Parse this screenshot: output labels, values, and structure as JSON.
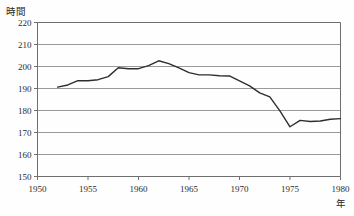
{
  "figure": {
    "background_color": "#fefefe",
    "frame_color": "#6e6e6e",
    "gridline_color": "#9a9a9a",
    "series_color": "#2e2e2e"
  },
  "axis_titles": {
    "y": "時間",
    "x": "年"
  },
  "chart_data": {
    "type": "line",
    "title": "",
    "subtitle": "",
    "xlabel": "年",
    "ylabel": "時間",
    "xlim": [
      1950,
      1980
    ],
    "ylim": [
      150,
      220
    ],
    "grid": true,
    "legend": "none",
    "x_ticks": [
      1950,
      1955,
      1960,
      1965,
      1970,
      1975,
      1980
    ],
    "x_tick_labels": [
      "1950",
      "1955",
      "1960",
      "1965",
      "1970",
      "1975",
      "1980"
    ],
    "y_ticks": [
      150,
      160,
      170,
      180,
      190,
      200,
      210,
      220
    ],
    "y_tick_labels": [
      "150",
      "160",
      "170",
      "180",
      "190",
      "200",
      "210",
      "220"
    ],
    "series": [
      {
        "name": "年間総実労働時間",
        "color": "#2e2e2e",
        "x": [
          1952,
          1953,
          1954,
          1955,
          1956,
          1957,
          1958,
          1959,
          1960,
          1961,
          1962,
          1963,
          1964,
          1965,
          1966,
          1967,
          1968,
          1969,
          1970,
          1971,
          1972,
          1973,
          1974,
          1975,
          1976,
          1977,
          1978,
          1979,
          1980
        ],
        "values": [
          190.6,
          191.6,
          193.6,
          193.5,
          194.0,
          195.4,
          199.4,
          199.0,
          199.0,
          200.4,
          202.6,
          201.3,
          199.4,
          197.2,
          196.2,
          196.2,
          195.8,
          195.7,
          193.5,
          191.2,
          188.0,
          186.2,
          179.8,
          172.6,
          175.5,
          175.0,
          175.2,
          176.0,
          176.3
        ]
      }
    ]
  }
}
